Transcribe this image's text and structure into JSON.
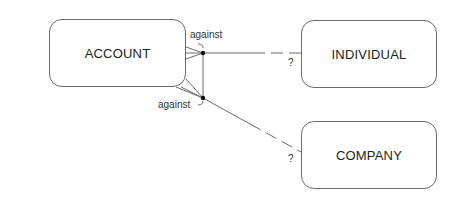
{
  "diagram": {
    "type": "entity-relationship",
    "entities": [
      {
        "id": "account",
        "label": "ACCOUNT"
      },
      {
        "id": "individual",
        "label": "INDIVIDUAL"
      },
      {
        "id": "company",
        "label": "COMPANY"
      }
    ],
    "relationships": [
      {
        "from": "account",
        "to": "individual",
        "label": "against",
        "from_cardinality": "many",
        "to_marker": "?",
        "exclusive_arc": true
      },
      {
        "from": "account",
        "to": "company",
        "label": "against",
        "from_cardinality": "many",
        "to_marker": "?",
        "exclusive_arc": true
      }
    ],
    "colors": {
      "line": "#6b6b6b",
      "text": "#222222",
      "dot": "#111111"
    }
  }
}
